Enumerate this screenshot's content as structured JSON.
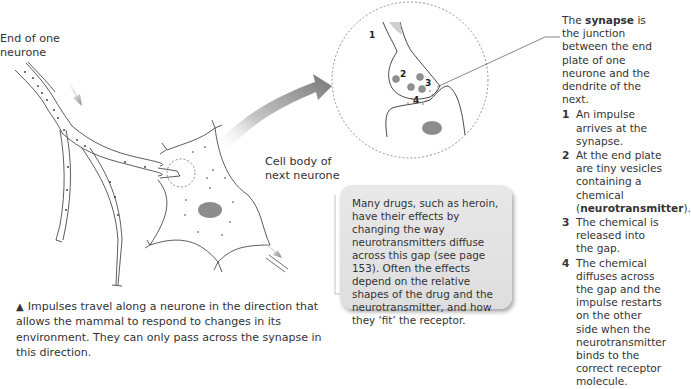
{
  "labels": {
    "end_of_neurone": [
      "End of one",
      "neurone"
    ],
    "cell_body": [
      "Cell body of",
      "next neurone"
    ],
    "synapse_numbers": [
      "1",
      "2",
      "3",
      "4"
    ]
  },
  "explanation": {
    "intro_pre": "The ",
    "intro_term": "synapse",
    "intro_post": " is the junction between the end plate of one neurone and the dendrite of the next.",
    "steps": [
      {
        "num": "1",
        "text": "An impulse arrives at the synapse."
      },
      {
        "num": "2",
        "text_pre": "At the end plate are tiny vesicles containing a chemical (",
        "term": "neurotransmitter",
        "text_post": ")."
      },
      {
        "num": "3",
        "text": "The chemical is released into the gap."
      },
      {
        "num": "4",
        "text": "The chemical diffuses across the gap and the impulse restarts on the other side when the neurotransmitter binds to the correct receptor molecule."
      }
    ]
  },
  "note_box": {
    "text": "Many drugs, such as heroin, have their effects by changing the way neurotransmitters diffuse across this gap (see page 153). Often the effects depend on the relative shapes of the drug and the neurotransmitter, and how they ‘fit’ the receptor."
  },
  "caption": {
    "marker": "▲",
    "text": "Impulses travel along a neurone in the direction that allows the mammal to respond to changes in its environment. They can only pass across the synapse in this direction."
  },
  "colors": {
    "line": "#333333",
    "arrow_gray": "#808080",
    "nucleus": "#8c8c8c",
    "vesicle": "#909090",
    "box_bg": "#e3e3e3"
  }
}
